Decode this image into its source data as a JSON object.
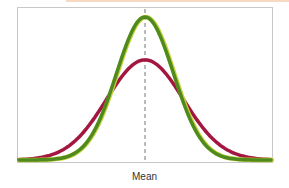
{
  "chart_data": {
    "type": "line",
    "title": "",
    "xlabel": "Mean",
    "ylabel": "",
    "grid": false,
    "legend": null,
    "annotations": [
      {
        "type": "vertical-dashed-line",
        "at": "mean",
        "label": "Mean"
      }
    ],
    "series": [
      {
        "name": "Wider normal distribution (larger standard deviation)",
        "color": "#a3163f",
        "peak_relative_height": 0.7,
        "relative_sigma": 1.35
      },
      {
        "name": "Narrower normal distribution (smaller standard deviation)",
        "color": "#4f8a1e",
        "peak_relative_height": 1.0,
        "relative_sigma": 1.0
      }
    ],
    "x_range": [
      -3.5,
      3.5
    ],
    "ylim": [
      0,
      1.05
    ]
  },
  "labels": {
    "mean": "Mean"
  },
  "colors": {
    "red_curve": "#a3163f",
    "green_curve": "#4f8a1e",
    "green_highlight": "#c7d13a",
    "mean_line": "#777777",
    "frame": "#c8c8c8"
  }
}
